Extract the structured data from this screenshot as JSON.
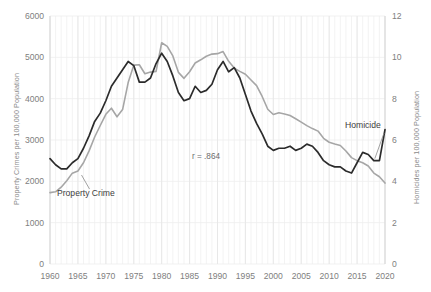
{
  "chart_data": {
    "type": "line",
    "title": "",
    "xlabel": "",
    "ylabel": "Property Crimes per 100,000 Population",
    "y2label": "Homicides per 100,000 Population",
    "xlim": [
      1960,
      2020
    ],
    "ylim": [
      0,
      6000
    ],
    "y2lim": [
      0,
      12
    ],
    "grid": true,
    "legend_position": "inline-annotation",
    "x_ticks": [
      "1960",
      "1965",
      "1970",
      "1975",
      "1980",
      "1985",
      "1990",
      "1995",
      "2000",
      "2005",
      "2010",
      "2015",
      "2020"
    ],
    "y_ticks": [
      "0",
      "1000",
      "2000",
      "3000",
      "4000",
      "5000",
      "6000"
    ],
    "y2_ticks": [
      "0",
      "2",
      "4",
      "6",
      "8",
      "10",
      "12"
    ],
    "annotations": [
      {
        "text": "r = .864",
        "x": 1988,
        "y_frac": 0.52
      }
    ],
    "x": [
      1960,
      1961,
      1962,
      1963,
      1964,
      1965,
      1966,
      1967,
      1968,
      1969,
      1970,
      1971,
      1972,
      1973,
      1974,
      1975,
      1976,
      1977,
      1978,
      1979,
      1980,
      1981,
      1982,
      1983,
      1984,
      1985,
      1986,
      1987,
      1988,
      1989,
      1990,
      1991,
      1992,
      1993,
      1994,
      1995,
      1996,
      1997,
      1998,
      1999,
      2000,
      2001,
      2002,
      2003,
      2004,
      2005,
      2006,
      2007,
      2008,
      2009,
      2010,
      2011,
      2012,
      2013,
      2014,
      2015,
      2016,
      2017,
      2018,
      2019,
      2020
    ],
    "series": [
      {
        "name": "Property Crime",
        "color": "#a6a6a6",
        "axis": "left",
        "unit": "per 100,000 population",
        "label_at": {
          "x": 1966,
          "y": 1500
        },
        "values": [
          1726,
          1747,
          1857,
          2012,
          2198,
          2249,
          2450,
          2736,
          3072,
          3351,
          3621,
          3769,
          3561,
          3737,
          4390,
          4811,
          4820,
          4602,
          4643,
          4660,
          5353,
          5264,
          5033,
          4637,
          4492,
          4651,
          4863,
          4940,
          5027,
          5078,
          5089,
          5140,
          4903,
          4740,
          4660,
          4591,
          4451,
          4316,
          4053,
          3744,
          3618,
          3658,
          3631,
          3591,
          3514,
          3432,
          3347,
          3276,
          3215,
          3041,
          2946,
          2905,
          2868,
          2734,
          2574,
          2500,
          2451,
          2371,
          2200,
          2110,
          1958
        ]
      },
      {
        "name": "Homicide",
        "color": "#2b2b2b",
        "axis": "right",
        "unit": "per 100,000 population",
        "label_at": {
          "x": 2013,
          "y": 6.6
        },
        "values": [
          5.1,
          4.8,
          4.6,
          4.6,
          4.9,
          5.1,
          5.6,
          6.2,
          6.9,
          7.3,
          7.9,
          8.6,
          9.0,
          9.4,
          9.8,
          9.6,
          8.8,
          8.8,
          9.0,
          9.7,
          10.2,
          9.8,
          9.1,
          8.3,
          7.9,
          8.0,
          8.6,
          8.3,
          8.4,
          8.7,
          9.4,
          9.8,
          9.3,
          9.5,
          9.0,
          8.2,
          7.4,
          6.8,
          6.3,
          5.7,
          5.5,
          5.6,
          5.6,
          5.7,
          5.5,
          5.6,
          5.8,
          5.7,
          5.4,
          5.0,
          4.8,
          4.7,
          4.7,
          4.5,
          4.4,
          4.9,
          5.4,
          5.3,
          5.0,
          5.0,
          6.5
        ]
      }
    ]
  }
}
